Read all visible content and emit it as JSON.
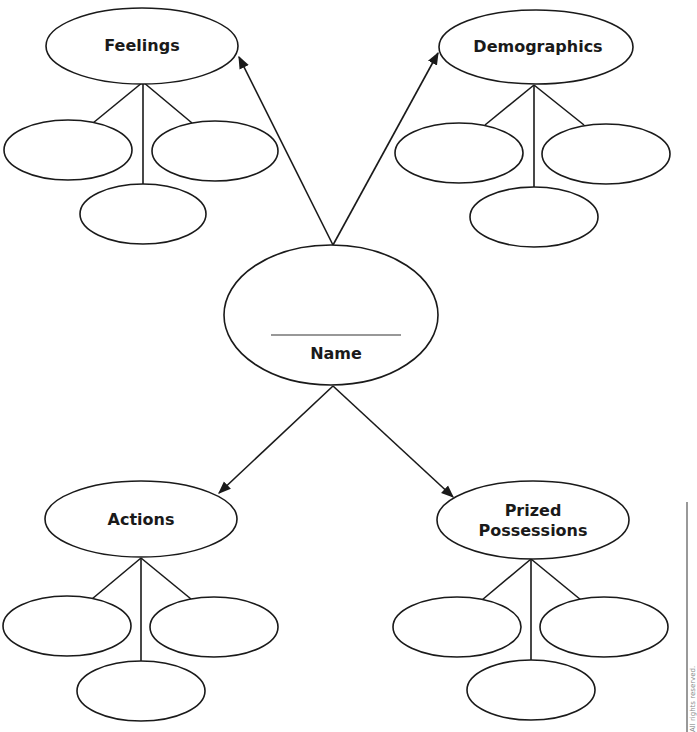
{
  "diagram": {
    "center": {
      "label": "Name",
      "has_blank_line": true
    },
    "categories": [
      {
        "id": "feelings",
        "label_lines": [
          "Feelings"
        ],
        "children": 3
      },
      {
        "id": "demographics",
        "label_lines": [
          "Demographics"
        ],
        "children": 3
      },
      {
        "id": "actions",
        "label_lines": [
          "Actions"
        ],
        "children": 3
      },
      {
        "id": "prized-possessions",
        "label_lines": [
          "Prized",
          "Possessions"
        ],
        "children": 3
      }
    ],
    "side_note": "All rights reserved."
  }
}
